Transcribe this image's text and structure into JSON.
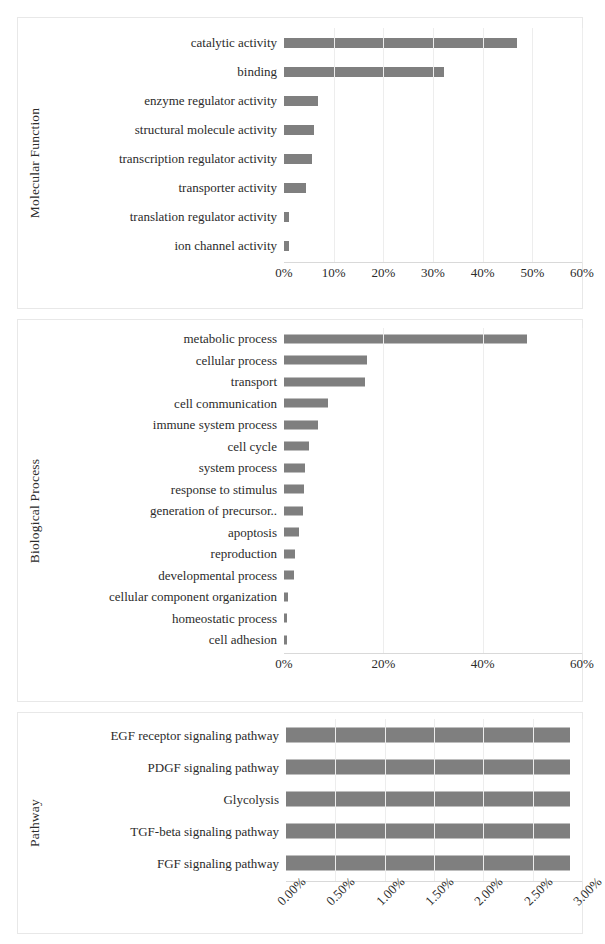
{
  "figure": {
    "bar_color": "#7f7f7f",
    "grid_color": "#ededed",
    "panel_border_color": "#e8e8e8"
  },
  "chart_data": [
    {
      "type": "bar",
      "orientation": "horizontal",
      "title": "",
      "ylabel": "Molecular Function",
      "xlabel": "",
      "grid": true,
      "legend": "none",
      "xlim": [
        0,
        60
      ],
      "xticks": [
        0,
        10,
        20,
        30,
        40,
        50,
        60
      ],
      "xticklabels": [
        "0%",
        "10%",
        "20%",
        "30%",
        "40%",
        "50%",
        "60%"
      ],
      "categories": [
        "ion channel activity",
        "translation regulator activity",
        "transporter activity",
        "transcription regulator activity",
        "structural molecule activity",
        "enzyme regulator activity",
        "binding",
        "catalytic activity"
      ],
      "values": [
        1.0,
        1.0,
        4.5,
        5.6,
        6.0,
        6.8,
        32.3,
        47.0
      ]
    },
    {
      "type": "bar",
      "orientation": "horizontal",
      "title": "",
      "ylabel": "Biological Process",
      "xlabel": "",
      "grid": true,
      "legend": "none",
      "xlim": [
        0,
        60
      ],
      "xticks": [
        0,
        20,
        40,
        60
      ],
      "xticklabels": [
        "0%",
        "20%",
        "40%",
        "60%"
      ],
      "categories": [
        "cell adhesion",
        "homeostatic process",
        "cellular component organization",
        "developmental process",
        "reproduction",
        "apoptosis",
        "generation of precursor..",
        "response to stimulus",
        "system process",
        "cell cycle",
        "immune system process",
        "cell communication",
        "transport",
        "cellular process",
        "metabolic process"
      ],
      "values": [
        0.7,
        0.7,
        0.8,
        2.1,
        2.3,
        3.1,
        3.9,
        4.1,
        4.3,
        5.0,
        6.9,
        8.9,
        16.3,
        16.8,
        49.0
      ]
    },
    {
      "type": "bar",
      "orientation": "horizontal",
      "title": "",
      "ylabel": "Pathway",
      "xlabel": "",
      "grid": true,
      "legend": "none",
      "xlim": [
        0,
        3.0
      ],
      "xticks": [
        0,
        0.5,
        1.0,
        1.5,
        2.0,
        2.5,
        3.0
      ],
      "xticklabels": [
        "0.00%",
        "0.50%",
        "1.00%",
        "1.50%",
        "2.00%",
        "2.50%",
        "3.00%"
      ],
      "categories": [
        "FGF signaling pathway",
        "TGF-beta signaling pathway",
        "Glycolysis",
        "PDGF signaling pathway",
        "EGF receptor signaling pathway"
      ],
      "values": [
        2.88,
        2.88,
        2.88,
        2.88,
        2.88
      ]
    }
  ]
}
